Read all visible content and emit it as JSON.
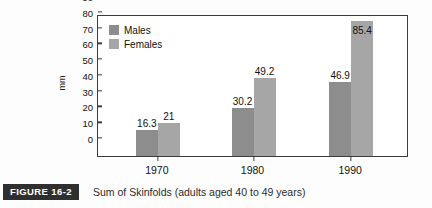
{
  "chart_data": {
    "type": "bar",
    "title": "",
    "xlabel": "",
    "ylabel": "mm",
    "categories": [
      "1970",
      "1980",
      "1990"
    ],
    "series": [
      {
        "name": "Males",
        "values": [
          16.3,
          30.2,
          46.9
        ],
        "color": "#8d8d8d"
      },
      {
        "name": "Females",
        "values": [
          21,
          49.2,
          85.4
        ],
        "color": "#a6a6a6"
      }
    ],
    "value_labels": [
      [
        "16.3",
        "21"
      ],
      [
        "30.2",
        "49.2"
      ],
      [
        "46.9",
        "85.4"
      ]
    ],
    "ylim": [
      0,
      90
    ],
    "yticks": [
      0,
      10,
      20,
      30,
      40,
      50,
      60,
      70,
      80,
      90
    ],
    "ytick_labels": [
      "0",
      "10",
      "20",
      "30",
      "40",
      "50",
      "60",
      "70",
      "80",
      "90"
    ],
    "grid": false,
    "legend_position": "top-left"
  },
  "caption": {
    "figure_label": "FIGURE 16-2",
    "text": "Sum of Skinfolds (adults aged 40 to 49 years)"
  }
}
